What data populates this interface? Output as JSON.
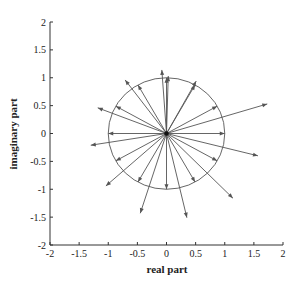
{
  "chart_data": {
    "type": "scatter",
    "subtype": "complex-plane vector plot",
    "title": "",
    "xlabel": "real part",
    "ylabel": "imaginary part",
    "xlim": [
      -2,
      2
    ],
    "ylim": [
      -2,
      2
    ],
    "xticks": [
      "-2",
      "-1.5",
      "-1",
      "-0.5",
      "0",
      "0.5",
      "1",
      "1.5",
      "2"
    ],
    "yticks": [
      "-2",
      "-1.5",
      "-1",
      "-0.5",
      "0",
      "0.5",
      "1",
      "1.5",
      "2"
    ],
    "grid": false,
    "legend": null,
    "unit_circle": {
      "center": [
        0,
        0
      ],
      "radius": 1
    },
    "series": [
      {
        "name": "unit-circle vectors",
        "points": [
          [
            1.0,
            0.0
          ],
          [
            0.87,
            0.49
          ],
          [
            0.49,
            0.87
          ],
          [
            0.0,
            1.0
          ],
          [
            -0.49,
            0.87
          ],
          [
            -0.87,
            0.49
          ],
          [
            -1.0,
            0.0
          ],
          [
            -0.87,
            -0.49
          ],
          [
            -0.49,
            -0.87
          ],
          [
            0.0,
            -1.0
          ],
          [
            0.49,
            -0.87
          ],
          [
            0.87,
            -0.49
          ]
        ]
      },
      {
        "name": "resultant vectors",
        "points": [
          [
            1.73,
            0.53
          ],
          [
            1.57,
            -0.4
          ],
          [
            1.14,
            -1.16
          ],
          [
            0.35,
            -1.51
          ],
          [
            -0.45,
            -1.43
          ],
          [
            -1.04,
            -0.94
          ],
          [
            -1.3,
            -0.21
          ],
          [
            -1.18,
            0.46
          ],
          [
            -0.71,
            0.96
          ],
          [
            -0.08,
            1.14
          ],
          [
            0.51,
            0.94
          ],
          [
            0.03,
            1.03
          ]
        ]
      }
    ]
  },
  "colors": {
    "axis": "#333333",
    "vector": "#555555",
    "circle": "#555555"
  }
}
